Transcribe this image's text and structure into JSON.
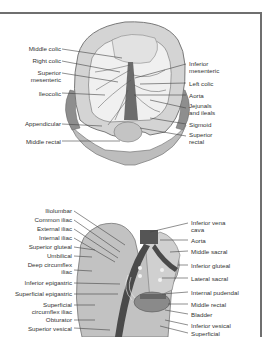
{
  "figure_top": {
    "subject": "Arteries of the colon",
    "labels_left": [
      "Middle colic",
      "Right colic",
      "Superior mesenteric",
      "Ileocolic",
      "Appendicular",
      "Middle rectal"
    ],
    "labels_right": [
      "Inferior mesenteric",
      "Left colic",
      "Aorta",
      "Jejunals and ileals",
      "Sigmoid",
      "Superior rectal"
    ]
  },
  "figure_bottom": {
    "subject": "Arteries of the pelvis",
    "labels_left": [
      "Iliolumbar",
      "Common iliac",
      "External iliac",
      "Internal iliac",
      "Superior gluteal",
      "Umbilical",
      "Deep circumflex iliac",
      "Inferior epigastric",
      "Superficial epigastric",
      "Superficial circumflex iliac",
      "Obturator",
      "Superior vesical"
    ],
    "labels_right": [
      "Inferior vena cava",
      "Aorta",
      "Middle sacral",
      "Inferior gluteal",
      "Lateral sacral",
      "Internal pudendal",
      "Middle rectal",
      "Bladder",
      "Inferior vesical",
      "Superficial"
    ]
  },
  "colors": {
    "frame": "#6f6f6f",
    "tissue": "#c8c8c8",
    "vessel": "#4a4a4a",
    "text": "#333333"
  }
}
